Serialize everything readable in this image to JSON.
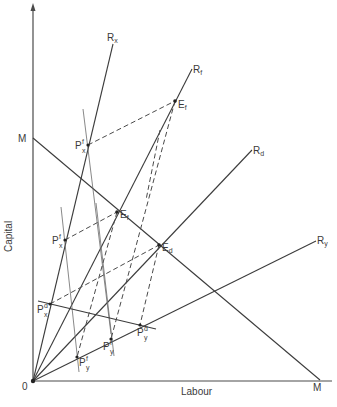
{
  "axes": {
    "y_label": "Capital",
    "x_label": "Labour",
    "origin_label": "0",
    "y_intercept_label": "M",
    "x_intercept_label": "M"
  },
  "rays": [
    {
      "id": "rx",
      "main": "R",
      "sub": "x"
    },
    {
      "id": "rf",
      "main": "R",
      "sub": "f"
    },
    {
      "id": "rd",
      "main": "R",
      "sub": "d"
    },
    {
      "id": "ry",
      "main": "R",
      "sub": "y"
    }
  ],
  "points": [
    {
      "id": "ef_upper",
      "main": "E",
      "sub": "f"
    },
    {
      "id": "ef_inner",
      "main": "E",
      "sub": "f"
    },
    {
      "id": "ed",
      "main": "E",
      "sub": "d"
    },
    {
      "id": "pxf_upper",
      "main": "P",
      "sub": "x",
      "sup": "f"
    },
    {
      "id": "pxf_mid",
      "main": "P",
      "sub": "x",
      "sup": "f"
    },
    {
      "id": "pxd",
      "main": "P",
      "sub": "x",
      "sup": "d"
    },
    {
      "id": "pyf",
      "main": "P",
      "sub": "y",
      "sup": "f"
    },
    {
      "id": "pyf2",
      "main": "P",
      "sub": "y",
      "sup": "f"
    },
    {
      "id": "pyd",
      "main": "P",
      "sub": "y",
      "sup": "d"
    }
  ],
  "colors": {
    "line": "#3c3c3c",
    "background": "#ffffff"
  }
}
